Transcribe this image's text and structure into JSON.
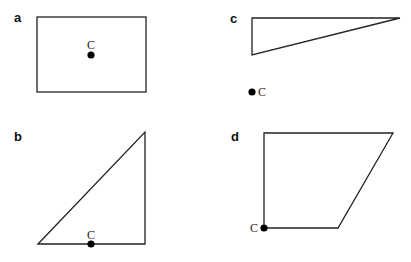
{
  "panels": [
    {
      "id": "a",
      "label": "a",
      "shape": "rectangle",
      "point": {
        "label": "C",
        "position": "center"
      }
    },
    {
      "id": "b",
      "label": "b",
      "shape": "right-triangle",
      "point": {
        "label": "C",
        "position": "midpoint of base"
      }
    },
    {
      "id": "c",
      "label": "c",
      "shape": "thin-right-triangle",
      "point": {
        "label": "C",
        "position": "outside shape, below"
      }
    },
    {
      "id": "d",
      "label": "d",
      "shape": "trapezoid",
      "point": {
        "label": "C",
        "position": "bottom-left vertex"
      }
    }
  ],
  "colors": {
    "stroke": "#222222",
    "dot": "#000000",
    "background": "#ffffff"
  }
}
